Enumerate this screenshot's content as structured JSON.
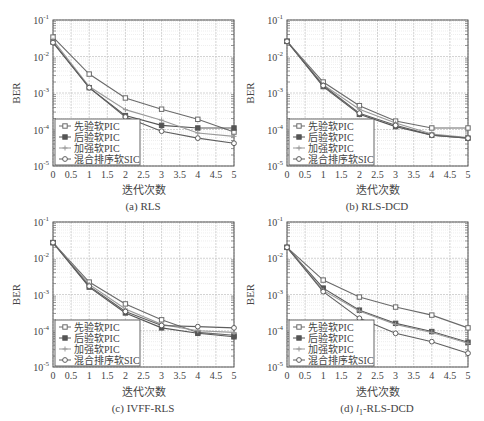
{
  "figure": {
    "legend": [
      "先验软PIC",
      "后验软PIC",
      "加强软PIC",
      "混合排序软SIC"
    ],
    "ylabel": "BER",
    "xlabel": "迭代次数",
    "xticks": [
      "0",
      "0.5",
      "1",
      "1.5",
      "2",
      "2.5",
      "3",
      "3.5",
      "4",
      "4.5",
      "5"
    ],
    "yticks": [
      "10^-5",
      "10^-4",
      "10^-3",
      "10^-2",
      "10^-1"
    ]
  },
  "chart_data": [
    {
      "type": "line",
      "title": "(a) RLS",
      "xlabel": "迭代次数",
      "ylabel": "BER",
      "yscale": "log",
      "ylim": [
        1e-05,
        0.1
      ],
      "xlim": [
        0,
        5
      ],
      "grid": true,
      "legend_position": "lower left",
      "x": [
        0,
        1,
        2,
        3,
        4,
        5
      ],
      "series": [
        {
          "name": "先验软PIC",
          "marker": "square",
          "values": [
            0.034,
            0.0033,
            0.00073,
            0.00036,
            0.00019,
            8.5e-05
          ]
        },
        {
          "name": "后验软PIC",
          "marker": "filled-square",
          "values": [
            0.025,
            0.0014,
            0.00024,
            0.00013,
            0.00011,
            0.00011
          ]
        },
        {
          "name": "加强软PIC",
          "marker": "plus",
          "values": [
            0.028,
            0.0015,
            0.00035,
            0.00018,
            8e-05,
            6.5e-05
          ]
        },
        {
          "name": "混合排序软SIC",
          "marker": "circle",
          "values": [
            0.024,
            0.0014,
            0.00022,
            9e-05,
            5.8e-05,
            4.2e-05
          ]
        }
      ]
    },
    {
      "type": "line",
      "title": "(b) RLS-DCD",
      "xlabel": "迭代次数",
      "ylabel": "BER",
      "yscale": "log",
      "ylim": [
        1e-05,
        0.1
      ],
      "xlim": [
        0,
        5
      ],
      "grid": true,
      "legend_position": "lower left",
      "x": [
        0,
        1,
        2,
        3,
        4,
        5
      ],
      "series": [
        {
          "name": "先验软PIC",
          "marker": "square",
          "values": [
            0.026,
            0.002,
            0.00045,
            0.00017,
            0.00011,
            0.00011
          ]
        },
        {
          "name": "后验软PIC",
          "marker": "filled-square",
          "values": [
            0.026,
            0.0015,
            0.00026,
            0.00012,
            7e-05,
            5.8e-05
          ]
        },
        {
          "name": "加强软PIC",
          "marker": "plus",
          "values": [
            0.026,
            0.0017,
            0.00036,
            0.00015,
            7.5e-05,
            6e-05
          ]
        },
        {
          "name": "混合排序软SIC",
          "marker": "circle",
          "values": [
            0.026,
            0.0016,
            0.00028,
            0.00013,
            7e-05,
            5.8e-05
          ]
        }
      ]
    },
    {
      "type": "line",
      "title": "(c) IVFF-RLS",
      "xlabel": "迭代次数",
      "ylabel": "BER",
      "yscale": "log",
      "ylim": [
        1e-05,
        0.1
      ],
      "xlim": [
        0,
        5
      ],
      "grid": true,
      "legend_position": "lower left",
      "x": [
        0,
        1,
        2,
        3,
        4,
        5
      ],
      "series": [
        {
          "name": "先验软PIC",
          "marker": "square",
          "values": [
            0.027,
            0.0022,
            0.00055,
            0.0002,
            9e-05,
            7.5e-05
          ]
        },
        {
          "name": "后验软PIC",
          "marker": "filled-square",
          "values": [
            0.027,
            0.0016,
            0.00031,
            0.00012,
            8.5e-05,
            6.8e-05
          ]
        },
        {
          "name": "加强软PIC",
          "marker": "plus",
          "values": [
            0.027,
            0.0019,
            0.0004,
            0.00015,
            0.0001,
            9e-05
          ]
        },
        {
          "name": "混合排序软SIC",
          "marker": "circle",
          "values": [
            0.027,
            0.0017,
            0.00034,
            0.00014,
            0.00013,
            0.00012
          ]
        }
      ]
    },
    {
      "type": "line",
      "title": "(d) l1-RLS-DCD",
      "xlabel": "迭代次数",
      "ylabel": "BER",
      "yscale": "log",
      "ylim": [
        1e-05,
        0.1
      ],
      "xlim": [
        0,
        5
      ],
      "grid": true,
      "legend_position": "lower left",
      "x": [
        0,
        1,
        2,
        3,
        4,
        5
      ],
      "series": [
        {
          "name": "先验软PIC",
          "marker": "square",
          "values": [
            0.02,
            0.0025,
            0.00085,
            0.00045,
            0.00027,
            0.00012
          ]
        },
        {
          "name": "后验软PIC",
          "marker": "filled-square",
          "values": [
            0.02,
            0.0015,
            0.00037,
            0.00016,
            9.5e-05,
            4.8e-05
          ]
        },
        {
          "name": "加强软PIC",
          "marker": "plus",
          "values": [
            0.02,
            0.0013,
            0.00035,
            0.00015,
            9e-05,
            4.5e-05
          ]
        },
        {
          "name": "混合排序软SIC",
          "marker": "circle",
          "values": [
            0.02,
            0.0012,
            0.00022,
            8.5e-05,
            5e-05,
            2.4e-05
          ]
        }
      ]
    }
  ],
  "captions": {
    "a_prefix": "(a) ",
    "a_name": "RLS",
    "b_prefix": "(b) ",
    "b_name": "RLS-DCD",
    "c_prefix": "(c) ",
    "c_name": "IVFF-RLS",
    "d_prefix": "(d) ",
    "d_italic": "l",
    "d_sub": "1",
    "d_name": "-RLS-DCD"
  },
  "colors": {
    "axis": "#555555",
    "grid": "#c8c8c8",
    "minor_grid": "#e2e2e2",
    "series": [
      "#6a6a6a",
      "#555555",
      "#999999",
      "#5e5e5e"
    ]
  }
}
